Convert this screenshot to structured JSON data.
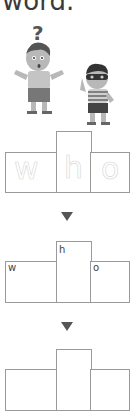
{
  "heading": "word.",
  "illustration": {
    "description": "confused boy with question mark and boy wearing mask",
    "question_mark": "?"
  },
  "word_shapes": [
    {
      "type": "traced",
      "letters": [
        "w",
        "h",
        "o"
      ]
    },
    {
      "type": "partial",
      "letters": [
        "w",
        "h",
        "o"
      ]
    },
    {
      "type": "empty",
      "letters": [
        "",
        "",
        ""
      ]
    }
  ],
  "arrow_icon": "down-triangle"
}
